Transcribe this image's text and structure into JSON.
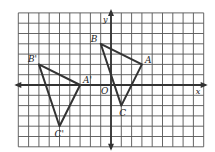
{
  "diagram": {
    "type": "coordinate-grid-translation",
    "grid": {
      "x_min": -9,
      "x_max": 9,
      "y_min": -6,
      "y_max": 7,
      "origin_px": [
        111,
        85
      ],
      "unit_px": 10.3,
      "line_color": "#555555",
      "axis_color": "#333333",
      "triangle_color": "#333333"
    },
    "axes": {
      "x_label": "x",
      "y_label": "y",
      "origin_label": "O"
    },
    "triangles": [
      {
        "name": "ABC",
        "vertices": [
          {
            "label": "A",
            "x": 3,
            "y": 2
          },
          {
            "label": "B",
            "x": -1,
            "y": 4
          },
          {
            "label": "C",
            "x": 1,
            "y": -2
          }
        ]
      },
      {
        "name": "A'B'C'",
        "vertices": [
          {
            "label": "A'",
            "x": -3,
            "y": 0
          },
          {
            "label": "B'",
            "x": -7,
            "y": 2
          },
          {
            "label": "C'",
            "x": -5,
            "y": -4
          }
        ]
      }
    ]
  }
}
